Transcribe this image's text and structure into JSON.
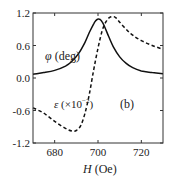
{
  "chart_data": {
    "type": "line",
    "title": "",
    "panel_label": "(b)",
    "xlabel": "H (Oe)",
    "xlabel_italic": "H",
    "xlabel_unit": "(Oe)",
    "ylabel": "",
    "xlim": [
      670,
      730
    ],
    "ylim": [
      -1.2,
      1.2
    ],
    "xticks": [
      680,
      700,
      720
    ],
    "xtick_labels": [
      "680",
      "700",
      "720"
    ],
    "yticks": [
      1.2,
      0.6,
      0.0,
      -0.6,
      -1.2
    ],
    "ytick_labels": [
      "1.2",
      "0.6",
      "0.0",
      "-0.6",
      "-1.2"
    ],
    "grid": false,
    "series": [
      {
        "name": "φ (deg)",
        "style": "solid",
        "color": "#111111",
        "x": [
          670,
          675,
          680,
          685,
          688,
          691,
          694,
          696,
          698,
          699,
          700,
          701,
          702,
          703,
          705,
          707,
          710,
          713,
          716,
          720,
          725,
          730
        ],
        "y": [
          0.07,
          0.1,
          0.14,
          0.22,
          0.31,
          0.45,
          0.66,
          0.84,
          1.0,
          1.06,
          1.09,
          1.08,
          1.03,
          0.95,
          0.76,
          0.58,
          0.39,
          0.27,
          0.19,
          0.13,
          0.1,
          0.08
        ]
      },
      {
        "name": "ε (×10⁻²)",
        "style": "dashed",
        "color": "#111111",
        "x": [
          670,
          675,
          680,
          685,
          688,
          690,
          692,
          694,
          696,
          698,
          700,
          702,
          704,
          706,
          708,
          710,
          713,
          716,
          720,
          725,
          730
        ],
        "y": [
          -0.55,
          -0.65,
          -0.8,
          -0.93,
          -0.98,
          -0.97,
          -0.88,
          -0.65,
          -0.3,
          0.15,
          0.55,
          0.88,
          1.06,
          1.13,
          1.12,
          1.03,
          0.9,
          0.79,
          0.69,
          0.6,
          0.53
        ]
      }
    ],
    "annotations": [
      {
        "text": "φ (deg)",
        "x": 690,
        "y": 0.6
      },
      {
        "text": "ε (×10⁻²)",
        "x": 688,
        "y": -0.45
      },
      {
        "text": "(b)",
        "x": 713,
        "y": -0.45
      }
    ]
  },
  "labels": {
    "phi_symbol": "φ",
    "phi_unit": " (deg)",
    "eps_symbol": "ε",
    "eps_unit_pre": " (×10",
    "eps_exp": "−2",
    "eps_unit_post": ")",
    "panel": "(b)",
    "x_italic": "H",
    "x_unit": " (Oe)"
  }
}
